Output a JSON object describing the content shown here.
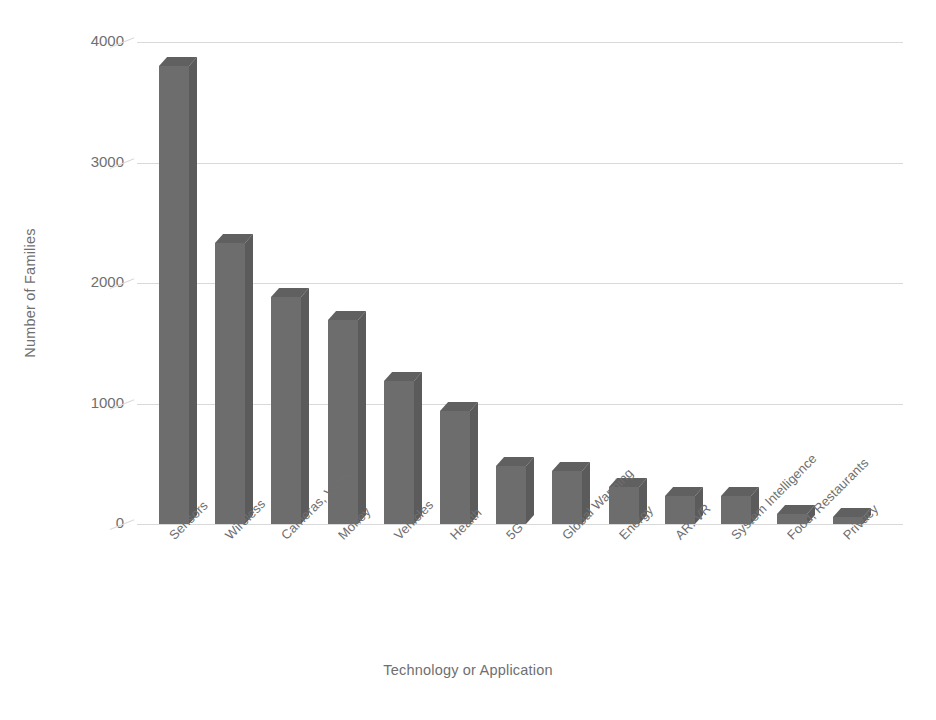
{
  "chart_data": {
    "type": "bar",
    "title": "",
    "subtitle": "",
    "xlabel": "Technology or Application",
    "ylabel": "Number of Families",
    "categories": [
      "Sensors",
      "Wireless",
      "Cameras, Video",
      "Money",
      "Vehicles",
      "Health",
      "5G",
      "Global Warming",
      "Energy",
      "AR. VR",
      "System Intelligence",
      "Food, Restaurants",
      "Privacy"
    ],
    "values": [
      3800,
      2330,
      1880,
      1690,
      1190,
      940,
      480,
      440,
      310,
      230,
      230,
      80,
      60
    ],
    "ylim": [
      0,
      4000
    ],
    "ytick_labels": [
      "0",
      "1000",
      "2000",
      "3000",
      "4000"
    ],
    "ytick_values": [
      0,
      1000,
      2000,
      3000,
      4000
    ],
    "grid": true,
    "legend": "none",
    "bar_color": "#6d6d6d",
    "bar_top_color": "#606060",
    "bar_side_color": "#5b5b5b",
    "gridline_color": "#d9d9d9",
    "text_color": "#6f6f6f",
    "background_color": "#ffffff",
    "style": "3d-column"
  }
}
